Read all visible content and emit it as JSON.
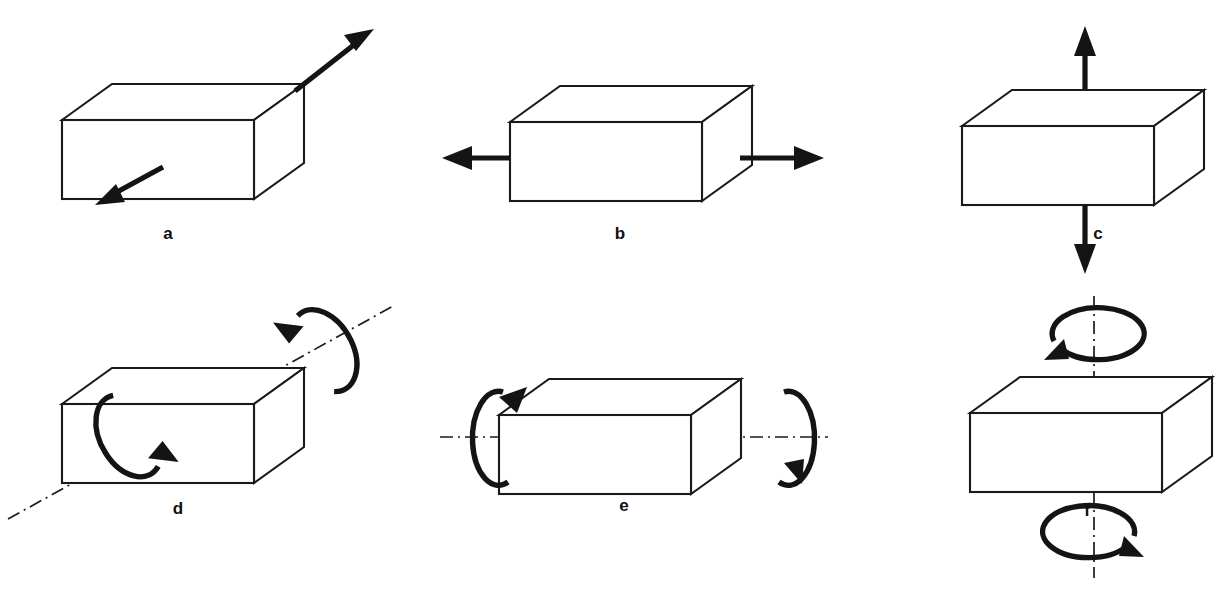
{
  "figure": {
    "background_color": "#ffffff",
    "line_color": "#1a1a1a",
    "arrow_color": "#141414",
    "width": 1227,
    "height": 589,
    "rows": 2,
    "columns": 3
  },
  "panels": [
    {
      "id": "a",
      "label": "a",
      "mode": "shear",
      "description": "Two antiparallel straight arrows applied to the block: one on the front face directed down-left, one from the top-right corner directed up-right",
      "arrow_count": 2,
      "arrow_type": "straight",
      "has_axis_line": false,
      "label_x": 168,
      "label_y": 239
    },
    {
      "id": "b",
      "label": "b",
      "mode": "horizontal-tension",
      "description": "Opposed horizontal straight arrows pointing outward to the left and to the right",
      "arrow_count": 2,
      "arrow_type": "straight",
      "has_axis_line": false,
      "label_x": 620,
      "label_y": 239
    },
    {
      "id": "c",
      "label": "c",
      "mode": "vertical-tension",
      "description": "Opposed vertical straight arrows pointing upward above the block and downward below the block",
      "arrow_count": 2,
      "arrow_type": "straight",
      "has_axis_line": false,
      "label_x": 1098,
      "label_y": 239
    },
    {
      "id": "d",
      "label": "d",
      "mode": "rotation-about-diagonal-axis",
      "description": "Rotation about an inclined dash-dot axis running diagonally through the block, shown by two tilted circular arrows",
      "arrow_count": 2,
      "arrow_type": "circular",
      "has_axis_line": true,
      "axis_style": "dash-dot",
      "label_x": 178,
      "label_y": 514
    },
    {
      "id": "e",
      "label": "e",
      "mode": "rotation-about-horizontal-axis",
      "description": "Rotation about a horizontal dash-dot axis through the block, shown by vertical elliptical arrows at the left and right ends",
      "arrow_count": 2,
      "arrow_type": "circular",
      "has_axis_line": true,
      "axis_style": "dash-dot",
      "label_x": 624,
      "label_y": 511
    },
    {
      "id": "f",
      "label": "f",
      "mode": "rotation-about-vertical-axis",
      "description": "Rotation about a vertical dash-dot axis through the block, shown by horizontal elliptical arrows above and below",
      "arrow_count": 2,
      "arrow_type": "circular",
      "has_axis_line": true,
      "axis_style": "dash-dot",
      "label_x": 1087,
      "label_y": 516
    }
  ]
}
